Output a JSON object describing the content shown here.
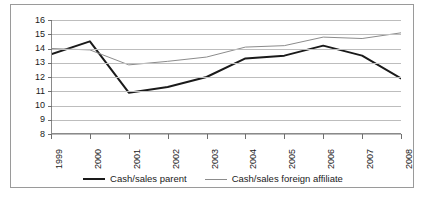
{
  "chart_data": {
    "type": "line",
    "title": "",
    "xlabel": "",
    "ylabel": "",
    "categories": [
      "1999",
      "2000",
      "2001",
      "2002",
      "2003",
      "2004",
      "2005",
      "2006",
      "2007",
      "2008"
    ],
    "ylim": [
      8,
      16
    ],
    "yticks": [
      16,
      15,
      14,
      13,
      12,
      11,
      10,
      9,
      8
    ],
    "grid": "horizontal",
    "legend_position": "bottom-center",
    "series": [
      {
        "name": "Cash/sales parent",
        "color": "#1a1a1a",
        "width": 2,
        "values": [
          13.6,
          14.5,
          10.9,
          11.3,
          12.0,
          13.3,
          13.5,
          14.2,
          13.5,
          11.9
        ]
      },
      {
        "name": "Cash/sales foreign affiliate",
        "color": "#8c8c8c",
        "width": 1,
        "values": [
          14.0,
          13.9,
          12.85,
          13.1,
          13.4,
          14.1,
          14.2,
          14.8,
          14.7,
          15.1
        ]
      }
    ]
  },
  "legend": {
    "items": [
      {
        "label": "Cash/sales parent"
      },
      {
        "label": "Cash/sales foreign affiliate"
      }
    ]
  }
}
